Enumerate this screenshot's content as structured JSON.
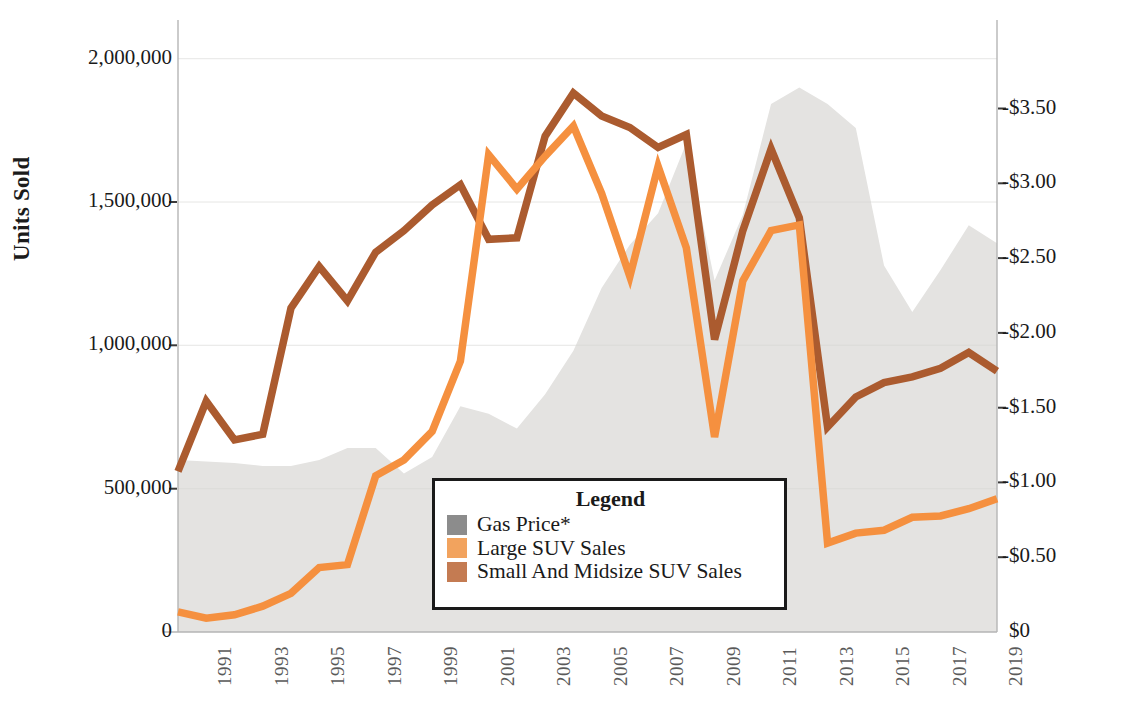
{
  "axes": {
    "ylabel_left": "Units Sold",
    "yticks_left": [
      "2,000,000",
      "1,500,000",
      "1,000,000",
      "500,000",
      "0"
    ],
    "ytick_left_values": [
      2000000,
      1500000,
      1000000,
      500000,
      0
    ],
    "yticks_right": [
      "-$3.50",
      "-$3.00",
      "-$2.50",
      "-$2.00",
      "-$1.50",
      "-$1.00",
      "-$0.50",
      "$0"
    ],
    "ytick_right_values": [
      3.5,
      3.0,
      2.5,
      2.0,
      1.5,
      1.0,
      0.5,
      0
    ],
    "xticks": [
      "1991",
      "1993",
      "1995",
      "1997",
      "1999",
      "2001",
      "2003",
      "2005",
      "2007",
      "2009",
      "2011",
      "2013",
      "2015",
      "2017",
      "2019"
    ]
  },
  "legend": {
    "title": "Legend",
    "items": [
      {
        "label": "Gas Price*",
        "color": "#8c8c8c"
      },
      {
        "label": "Large SUV Sales",
        "color": "#f2a35e"
      },
      {
        "label": "Small And Midsize SUV Sales",
        "color": "#c47b52"
      }
    ]
  },
  "colors": {
    "gas_area": "#e4e3e1",
    "large_suv": "#f5903f",
    "small_midsize_suv": "#ab5b2f",
    "axis": "#9a9a9a",
    "text": "#1a1a1a"
  },
  "chart_data": {
    "type": "line",
    "title": "",
    "subtitle": "",
    "xlabel": "",
    "ylabel": "Units Sold",
    "ylabel_right": "Gas Price (dollars per gallon)",
    "ylim": [
      0,
      2100000
    ],
    "ylim_right": [
      0,
      4.025
    ],
    "grid": false,
    "legend_position": "inside-bottom-center",
    "x": [
      1990,
      1991,
      1992,
      1993,
      1994,
      1995,
      1996,
      1997,
      1998,
      1999,
      2000,
      2001,
      2002,
      2003,
      2004,
      2005,
      2006,
      2007,
      2008,
      2009,
      2010,
      2011,
      2012,
      2013,
      2014,
      2015,
      2016,
      2017,
      2018,
      2019
    ],
    "series": [
      {
        "name": "Gas Price*",
        "type": "area",
        "axis": "right",
        "unit": "USD per gallon",
        "values": [
          1.15,
          1.14,
          1.13,
          1.11,
          1.11,
          1.15,
          1.23,
          1.23,
          1.06,
          1.17,
          1.51,
          1.46,
          1.36,
          1.59,
          1.88,
          2.3,
          2.59,
          2.8,
          3.27,
          2.35,
          2.79,
          3.53,
          3.64,
          3.53,
          3.37,
          2.45,
          2.14,
          2.42,
          2.72,
          2.6
        ]
      },
      {
        "name": "Large SUV Sales",
        "type": "line",
        "axis": "left",
        "unit": "units",
        "values": [
          70000,
          48000,
          60000,
          90000,
          135000,
          225000,
          235000,
          545000,
          600000,
          700000,
          945000,
          1665000,
          1545000,
          1660000,
          1765000,
          1530000,
          1240000,
          1625000,
          1340000,
          680000,
          1225000,
          1400000,
          1420000,
          310000,
          345000,
          355000,
          400000,
          405000,
          430000,
          465000
        ]
      },
      {
        "name": "Small And Midsize SUV Sales",
        "type": "line",
        "axis": "left",
        "unit": "units",
        "values": [
          560000,
          805000,
          670000,
          690000,
          1130000,
          1275000,
          1155000,
          1325000,
          1400000,
          1490000,
          1560000,
          1370000,
          1375000,
          1730000,
          1880000,
          1800000,
          1760000,
          1690000,
          1735000,
          1020000,
          1400000,
          1685000,
          1445000,
          715000,
          820000,
          870000,
          890000,
          920000,
          975000,
          910000
        ]
      }
    ]
  }
}
